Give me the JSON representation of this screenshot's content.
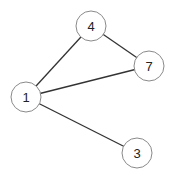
{
  "graph": {
    "node_radius": 15,
    "colors": {
      "edge": "#333333",
      "node_stroke": "#8a8a8a",
      "node_fill": "#ffffff",
      "label": "#222222"
    },
    "nodes": [
      {
        "id": "4",
        "label": "4",
        "x": 91,
        "y": 26
      },
      {
        "id": "7",
        "label": "7",
        "x": 149,
        "y": 66
      },
      {
        "id": "1",
        "label": "1",
        "x": 26,
        "y": 97
      },
      {
        "id": "3",
        "label": "3",
        "x": 137,
        "y": 153
      }
    ],
    "edges": [
      {
        "from": "1",
        "to": "4"
      },
      {
        "from": "1",
        "to": "7"
      },
      {
        "from": "1",
        "to": "3"
      },
      {
        "from": "4",
        "to": "7"
      }
    ]
  }
}
